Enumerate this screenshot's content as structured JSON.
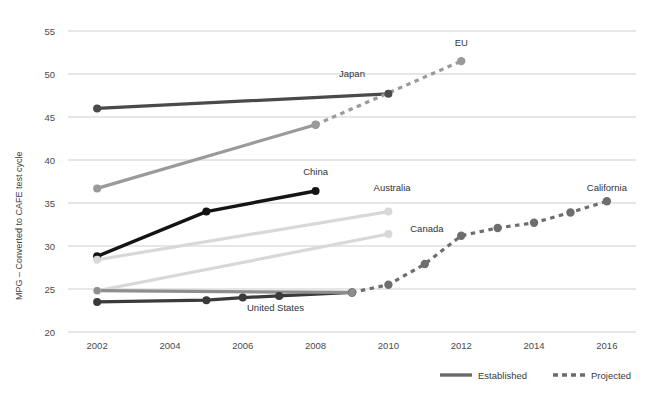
{
  "chart_data": {
    "type": "line",
    "title": "",
    "xlabel": "",
    "ylabel": "MPG – Converted to CAFE test cycle",
    "xlim": [
      2001.2,
      2016.8
    ],
    "ylim": [
      20,
      55
    ],
    "grid": true,
    "x_ticks": [
      "2002",
      "2004",
      "2006",
      "2008",
      "2010",
      "2012",
      "2014",
      "2016"
    ],
    "x_tick_values": [
      2002,
      2004,
      2006,
      2008,
      2010,
      2012,
      2014,
      2016
    ],
    "y_ticks": [
      "20",
      "25",
      "30",
      "35",
      "40",
      "45",
      "50",
      "55"
    ],
    "y_tick_values": [
      20,
      25,
      30,
      35,
      40,
      45,
      50,
      55
    ],
    "legend_position": "bottom",
    "legend": [
      {
        "name": "Established",
        "style": "solid"
      },
      {
        "name": "Projected",
        "style": "dashed"
      }
    ],
    "series": [
      {
        "name": "Japan",
        "style": "solid",
        "color": "#4a4a4a",
        "label_x": 2009.0,
        "label_y": 49.6,
        "label_anchor": "middle",
        "x": [
          2002,
          2010
        ],
        "values": [
          46.0,
          47.7
        ]
      },
      {
        "name": "EU",
        "style": "solid",
        "color": "#9a9a9a",
        "label_x": 2012.0,
        "label_y": 53.2,
        "label_anchor": "middle",
        "x": [
          2002,
          2008
        ],
        "values": [
          36.7,
          44.1
        ]
      },
      {
        "name": "EU projected",
        "style": "dashed",
        "color": "#9a9a9a",
        "x": [
          2008,
          2012
        ],
        "values": [
          44.1,
          51.5
        ]
      },
      {
        "name": "China",
        "style": "solid",
        "color": "#141414",
        "label_x": 2008.0,
        "label_y": 38.2,
        "label_anchor": "middle",
        "x": [
          2002,
          2005,
          2008
        ],
        "values": [
          28.8,
          34.0,
          36.4
        ]
      },
      {
        "name": "Australia",
        "style": "solid",
        "color": "#d8d8d8",
        "label_x": 2010.1,
        "label_y": 36.4,
        "label_anchor": "middle",
        "x": [
          2002,
          2010
        ],
        "values": [
          28.4,
          34.0
        ]
      },
      {
        "name": "Canada",
        "style": "solid",
        "color": "#d8d8d8",
        "label_x": 2010.6,
        "label_y": 31.6,
        "label_anchor": "start",
        "x": [
          2002,
          2010
        ],
        "values": [
          24.8,
          31.4
        ]
      },
      {
        "name": "United States",
        "style": "solid",
        "color": "#3a3a3a",
        "label_x": 2006.9,
        "label_y": 22.4,
        "label_anchor": "middle",
        "x": [
          2002,
          2005,
          2006,
          2007,
          2009
        ],
        "values": [
          23.5,
          23.7,
          24.0,
          24.2,
          24.6
        ]
      },
      {
        "name": "California",
        "style": "dashed",
        "color": "#6e6e6e",
        "label_x": 2016.0,
        "label_y": 36.4,
        "label_anchor": "middle",
        "x": [
          2009,
          2010,
          2011,
          2012,
          2013,
          2014,
          2015,
          2016
        ],
        "values": [
          24.6,
          25.5,
          27.9,
          31.2,
          32.1,
          32.7,
          33.9,
          35.2
        ]
      },
      {
        "name": "United States baseline",
        "style": "solid",
        "color": "#8e8e8e",
        "x": [
          2002,
          2009
        ],
        "values": [
          24.8,
          24.6
        ]
      }
    ]
  },
  "colors": {
    "gridline": "#cfcfcf",
    "text": "#3d3d3d",
    "background": "#ffffff"
  }
}
